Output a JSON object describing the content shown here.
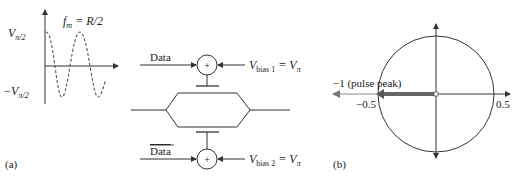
{
  "panel_a": {
    "label": "(a)",
    "waveform": {
      "freq_label_f": "f",
      "freq_label_sub": "m",
      "freq_label_rest": " = R/2",
      "v_pos_label": "V",
      "v_pos_sub": "π/2",
      "v_neg_label": "−V",
      "v_neg_sub": "π/2"
    },
    "modulator": {
      "data_label": "Data",
      "data_bar_label": "Data",
      "summer_symbol": "+",
      "bias1_V": "V",
      "bias1_sub": "bias 1",
      "bias1_eq": " = V",
      "bias1_eq_sub": "π",
      "bias2_V": "V",
      "bias2_sub": "bias 2",
      "bias2_eq": " = V",
      "bias2_eq_sub": "π"
    }
  },
  "panel_b": {
    "label": "(b)",
    "pulse_peak_label": "−1 (pulse peak)",
    "tick_neg": "−0.5",
    "tick_pos": "0.5"
  }
}
